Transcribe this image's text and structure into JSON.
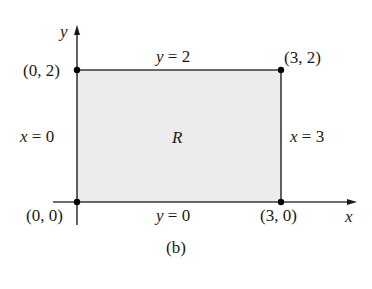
{
  "figure": {
    "caption": "(b)",
    "region_label": "R",
    "axes": {
      "x_label": "x",
      "y_label": "y"
    },
    "boundaries": {
      "top": "y = 2",
      "bottom": "y = 0",
      "left": "x = 0",
      "right": "x = 3"
    },
    "corners": {
      "top_left": "(0, 2)",
      "top_right": "(3, 2)",
      "bottom_left": "(0, 0)",
      "bottom_right": "(3, 0)"
    },
    "colors": {
      "region_fill": "#ececec",
      "lines": "#3a3a3a",
      "points": "#000000"
    }
  }
}
